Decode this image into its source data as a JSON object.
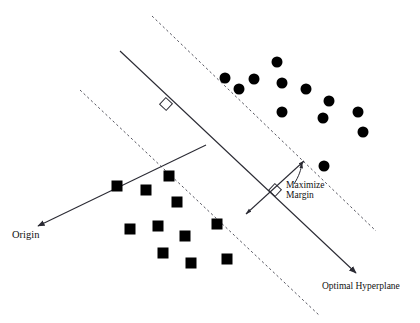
{
  "figure": {
    "background_color": "#ffffff",
    "stroke_color": "#2a2a33",
    "marker_color": "#000000",
    "width": 420,
    "height": 323
  },
  "labels": {
    "origin": "Origin",
    "optimal_hyperplane": "Optimal Hyperplane",
    "maximize": "Maximize",
    "margin": "Margin"
  },
  "chart_data": {
    "type": "scatter",
    "xlabel": "",
    "ylabel": "",
    "xlim": [
      0,
      420
    ],
    "ylim": [
      323,
      0
    ],
    "grid": false,
    "legend": null,
    "annotations": [
      {
        "name": "origin",
        "text": "Origin",
        "x": 12,
        "y": 236
      },
      {
        "name": "optimal-hyperplane",
        "text": "Optimal Hyperplane",
        "x": 322,
        "y": 288
      },
      {
        "name": "maximize-margin",
        "text": "Maximize Margin",
        "x": 286,
        "y": 190
      }
    ],
    "series": [
      {
        "name": "circles",
        "marker": "circle",
        "color": "#000000",
        "size": 11,
        "count": 12,
        "points": [
          [
            225,
            78
          ],
          [
            239,
            89
          ],
          [
            254,
            79
          ],
          [
            277,
            62
          ],
          [
            282,
            83
          ],
          [
            282,
            112
          ],
          [
            306,
            89
          ],
          [
            329,
            101
          ],
          [
            323,
            118
          ],
          [
            358,
            112
          ],
          [
            363,
            132
          ],
          [
            324,
            166
          ]
        ]
      },
      {
        "name": "squares",
        "marker": "square",
        "color": "#000000",
        "size": 11,
        "count": 11,
        "points": [
          [
            169,
            176
          ],
          [
            117,
            186
          ],
          [
            146,
            190
          ],
          [
            177,
            202
          ],
          [
            130,
            229
          ],
          [
            158,
            226
          ],
          [
            217,
            224
          ],
          [
            185,
            236
          ],
          [
            163,
            253
          ],
          [
            191,
            263
          ],
          [
            227,
            259
          ]
        ]
      }
    ],
    "lines": [
      {
        "name": "optimal-hyperplane-line",
        "style": "solid",
        "arrow_end": true,
        "x": [
          120,
          360
        ],
        "y": [
          51,
          277
        ]
      },
      {
        "name": "upper-margin-boundary",
        "style": "dashed",
        "arrow_end": false,
        "x": [
          152,
          376
        ],
        "y": [
          16,
          231
        ]
      },
      {
        "name": "lower-margin-boundary",
        "style": "dashed",
        "arrow_end": false,
        "x": [
          80,
          320
        ],
        "y": [
          90,
          316
        ]
      },
      {
        "name": "origin-normal-line",
        "style": "solid",
        "arrow_end": true,
        "x": [
          206,
          35
        ],
        "y": [
          145,
          228
        ]
      },
      {
        "name": "margin-width-line",
        "style": "solid",
        "arrow_both": true,
        "x": [
          305,
          245
        ],
        "y": [
          160,
          215
        ]
      },
      {
        "name": "margin-callout-arrow",
        "style": "solid",
        "arrow_end": true,
        "x": [
          296,
          303
        ],
        "y": [
          183,
          161
        ]
      }
    ],
    "right_angle_markers": [
      {
        "name": "hyperplane-normal-right-angle",
        "x": 166,
        "y": 104,
        "size": 9
      },
      {
        "name": "margin-right-angle",
        "x": 275,
        "y": 190,
        "size": 9
      }
    ]
  }
}
